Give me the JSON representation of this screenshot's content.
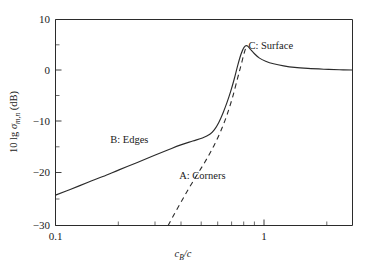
{
  "chart_data": {
    "type": "line",
    "title": "",
    "subtitle": "",
    "xlabel": "c_B/c",
    "xlabel_parts": {
      "lead": "c",
      "sub": "B",
      "tail": "/c"
    },
    "ylabel": "10 lg σ_{m,n} (dB)",
    "ylabel_parts": {
      "lead": "10 lg ",
      "sym": "σ",
      "sub": "m,n",
      "tail": " (dB)"
    },
    "xscale": "log",
    "yscale": "linear",
    "xlim": [
      0.1,
      4.0
    ],
    "ylim": [
      -30,
      10
    ],
    "grid": false,
    "legend": "none (inline annotations)",
    "xticks_major": [
      {
        "value": 0.1,
        "label": "0.1"
      },
      {
        "value": 1,
        "label": "1"
      }
    ],
    "xticks_minor": [
      0.2,
      0.3,
      0.4,
      0.5,
      0.6,
      0.7,
      0.8,
      0.9,
      2,
      3,
      4
    ],
    "yticks": [
      {
        "value": 10,
        "label": "10"
      },
      {
        "value": 0,
        "label": "0"
      },
      {
        "value": -10,
        "label": "−10"
      },
      {
        "value": -20,
        "label": "−20"
      },
      {
        "value": -30,
        "label": "−30"
      }
    ],
    "yticks_minor": [
      5,
      -5,
      -15,
      -25
    ],
    "annotations": [
      {
        "text": "A: Corners",
        "x": 0.62,
        "y": -21.0,
        "name": "annotation-a-corners"
      },
      {
        "text": "B: Edges",
        "x": 0.25,
        "y": -14.0,
        "name": "annotation-b-edges"
      },
      {
        "text": "C: Surface",
        "x": 1.45,
        "y": 4.3,
        "name": "annotation-c-surface"
      }
    ],
    "series": [
      {
        "name": "B: Edges / C: Surface (total, solid)",
        "style": "solid",
        "x": [
          0.1,
          0.12,
          0.15,
          0.18,
          0.22,
          0.27,
          0.33,
          0.4,
          0.47,
          0.55,
          0.62,
          0.68,
          0.72,
          0.76,
          0.8,
          0.84,
          0.88,
          0.92,
          0.96,
          1.0,
          1.04,
          1.08,
          1.12,
          1.18,
          1.26,
          1.36,
          1.5,
          1.7,
          1.95,
          2.3,
          2.8,
          3.4,
          4.0
        ],
        "y": [
          -24.1,
          -23.0,
          -21.6,
          -20.5,
          -19.2,
          -17.9,
          -16.6,
          -15.4,
          -14.4,
          -13.6,
          -13.0,
          -12.3,
          -11.4,
          -10.0,
          -8.2,
          -6.2,
          -4.0,
          -1.6,
          1.0,
          3.2,
          4.6,
          4.9,
          4.3,
          3.4,
          2.5,
          1.9,
          1.4,
          1.0,
          0.7,
          0.5,
          0.35,
          0.25,
          0.2
        ]
      },
      {
        "name": "A: Corners (dashed)",
        "style": "dashed",
        "x": [
          0.405,
          0.44,
          0.48,
          0.52,
          0.57,
          0.62,
          0.67,
          0.72,
          0.78,
          0.84,
          0.9,
          0.96,
          1.0,
          1.04,
          1.07
        ],
        "y": [
          -30.0,
          -27.6,
          -25.2,
          -23.0,
          -20.6,
          -18.5,
          -16.4,
          -14.3,
          -11.6,
          -8.6,
          -5.2,
          -1.4,
          1.0,
          3.4,
          4.8
        ]
      }
    ]
  },
  "figure": {
    "name": "scattering-cross-section-plot",
    "background": "#ffffff",
    "axis_color": "#2b2b2b"
  }
}
